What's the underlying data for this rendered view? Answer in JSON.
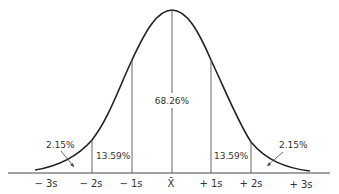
{
  "diagram": {
    "type": "normal-distribution-curve",
    "center_region": {
      "label": "68.26%"
    },
    "regions": [
      {
        "name": "left-inner",
        "label": "13.59%"
      },
      {
        "name": "right-inner",
        "label": "13.59%"
      },
      {
        "name": "left-tail",
        "label": "2.15%"
      },
      {
        "name": "right-tail",
        "label": "2.15%"
      }
    ],
    "axis_labels": [
      "− 3s",
      "− 2s",
      "− 1s",
      "X̄",
      "+ 1s",
      "+ 2s",
      "+ 3s"
    ],
    "colors": {
      "curve": "#222222",
      "lines": "#555555",
      "text": "#333333",
      "background": "#ffffff"
    }
  }
}
